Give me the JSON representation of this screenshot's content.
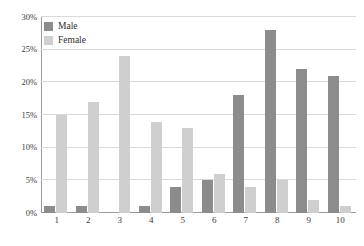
{
  "chart_data": {
    "type": "bar",
    "title": "",
    "subtitle": "",
    "xlabel": "",
    "ylabel": "",
    "categories": [
      "1",
      "2",
      "3",
      "4",
      "5",
      "6",
      "7",
      "8",
      "9",
      "10"
    ],
    "series": [
      {
        "name": "Male",
        "color": "#8c8c8c",
        "values": [
          1,
          1,
          0,
          1,
          4,
          5,
          18,
          28,
          22,
          21
        ]
      },
      {
        "name": "Female",
        "color": "#cfcfcf",
        "values": [
          15,
          17,
          24,
          14,
          13,
          6,
          4,
          5,
          2,
          1
        ]
      }
    ],
    "ylim": [
      0,
      30
    ],
    "ytick_values": [
      0,
      5,
      10,
      15,
      20,
      25,
      30
    ],
    "ytick_labels": [
      "0%",
      "5%",
      "10%",
      "15%",
      "20%",
      "25%",
      "30%"
    ],
    "grid": true,
    "grid_axis": "y",
    "legend_position": "top-left",
    "annotations": []
  },
  "legend": {
    "entries": [
      {
        "label": "Male"
      },
      {
        "label": "Female"
      }
    ]
  },
  "colors": {
    "male_bar": "#8c8c8c",
    "female_bar": "#cfcfcf",
    "gridline": "#d9d9d9",
    "axis": "#9a9a9a",
    "text": "#3a3a3a",
    "background": "#ffffff"
  }
}
